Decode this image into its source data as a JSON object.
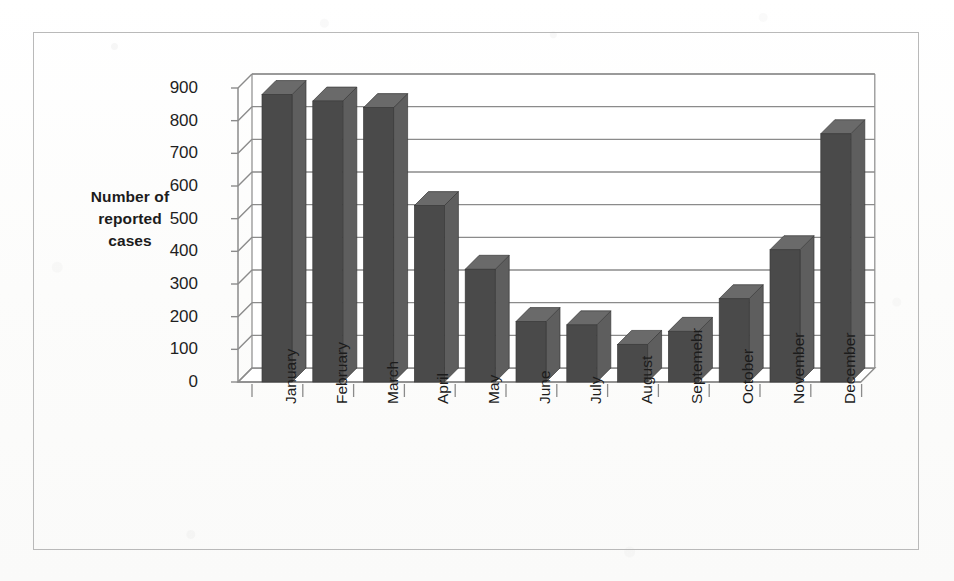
{
  "figure": {
    "has_border": true,
    "background": "#fdfdfd"
  },
  "chart_data": {
    "type": "bar",
    "title": "",
    "xlabel": "",
    "ylabel": "Number of reported cases",
    "ylabel_lines": [
      "Number of",
      "reported",
      "cases"
    ],
    "categories": [
      "January",
      "February",
      "March",
      "April",
      "May",
      "June",
      "July",
      "August",
      "Septemebr",
      "October",
      "November",
      "December"
    ],
    "values": [
      880,
      860,
      840,
      540,
      345,
      185,
      175,
      115,
      155,
      255,
      405,
      760
    ],
    "ytick_labels": [
      "900",
      "800",
      "700",
      "600",
      "500",
      "400",
      "300",
      "200",
      "100",
      "0"
    ],
    "yticks": [
      900,
      800,
      700,
      600,
      500,
      400,
      300,
      200,
      100,
      0
    ],
    "ylim": [
      0,
      900
    ],
    "grid": true,
    "legend": false,
    "style_3d": true,
    "bar_face_color": "#4a4a4a",
    "bar_top_color": "#6a6a6a",
    "bar_side_color": "#5e5e5e",
    "gridline_color": "#8b8b8b",
    "axis_color": "#8b8b8b",
    "text_color": "#1c1c1c"
  }
}
